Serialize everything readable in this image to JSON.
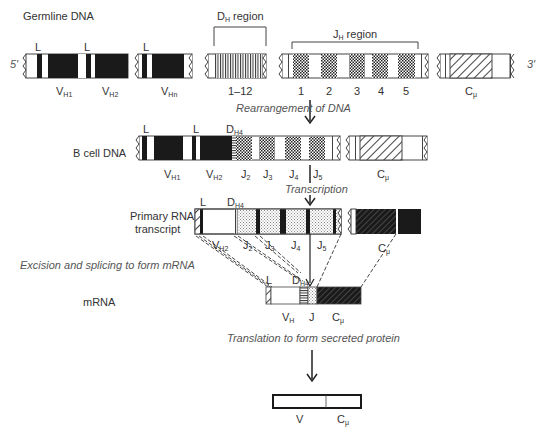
{
  "rows": {
    "germline": {
      "label": "Germline DNA",
      "five_prime": "5'",
      "three_prime": "3'",
      "leader": "L",
      "v_segments": [
        {
          "base": "V",
          "sub": "H1"
        },
        {
          "base": "V",
          "sub": "H2"
        },
        {
          "base": "V",
          "sub": "Hn"
        }
      ],
      "d_region": {
        "base": "D",
        "sub": "H",
        "suffix": " region",
        "range": "1–12"
      },
      "j_region": {
        "base": "J",
        "sub": "H",
        "suffix": " region",
        "numbers": [
          "1",
          "2",
          "3",
          "4",
          "5"
        ]
      },
      "c_segment": {
        "base": "C",
        "sub": "μ"
      }
    },
    "bcell": {
      "label": "B cell DNA",
      "leader": "L",
      "d_label": {
        "base": "D",
        "sub": "H4"
      },
      "segments": [
        {
          "base": "V",
          "sub": "H1"
        },
        {
          "base": "V",
          "sub": "H2"
        },
        {
          "base": "J",
          "sub": "2"
        },
        {
          "base": "J",
          "sub": "3"
        },
        {
          "base": "J",
          "sub": "4"
        },
        {
          "base": "J",
          "sub": "5"
        }
      ],
      "c_segment": {
        "base": "C",
        "sub": "μ"
      }
    },
    "primary_rna": {
      "label_line1": "Primary RNA",
      "label_line2": "transcript",
      "leader": "L",
      "d_label": {
        "base": "D",
        "sub": "H4"
      },
      "segments": [
        {
          "base": "V",
          "sub": "H2"
        },
        {
          "base": "J",
          "sub": "2"
        },
        {
          "base": "J",
          "sub": "3"
        },
        {
          "base": "J",
          "sub": "4"
        },
        {
          "base": "J",
          "sub": "5"
        }
      ],
      "c_segment": {
        "base": "C",
        "sub": "μ"
      },
      "d_h4_lower": {
        "base": "D",
        "sub": "H4"
      }
    },
    "mrna": {
      "label": "mRNA",
      "leader": "L",
      "segments": [
        {
          "base": "V",
          "sub": "H"
        },
        {
          "base": "J",
          "sub": ""
        },
        {
          "base": "C",
          "sub": "μ"
        }
      ]
    },
    "protein": {
      "segments": [
        {
          "base": "V",
          "sub": ""
        },
        {
          "base": "C",
          "sub": "μ"
        }
      ]
    }
  },
  "steps": {
    "rearrangement": "Rearrangement of DNA",
    "transcription": "Transcription",
    "splicing": "Excision and splicing to form mRNA",
    "translation": "Translation to form secreted protein"
  },
  "colors": {
    "ink": "#1a1a1a",
    "outline": "#444444",
    "label": "#333333",
    "italic": "#555555"
  }
}
